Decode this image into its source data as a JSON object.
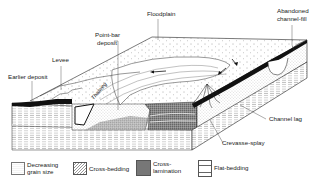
{
  "figure": {
    "type": "block-diagram"
  },
  "labels": {
    "floodplain": "Floodplain",
    "abandoned_channel_fill": "Abandoned\nchannel-fill",
    "abandoned_line1": "Abandoned",
    "abandoned_line2": "channel-fill",
    "point_bar_line1": "Point-bar",
    "point_bar_line2": "deposit",
    "levee": "Levee",
    "earlier_deposit": "Earlier deposit",
    "thalweg": "Thalweg",
    "channel_lag": "Channel lag",
    "crevasse_splay": "Crevasse-splay"
  },
  "legend": {
    "items": [
      {
        "key": "decreasing-grain-size",
        "label": "Decreasing\ngrain size"
      },
      {
        "key": "cross-bedding",
        "label": "Cross-bedding"
      },
      {
        "key": "cross-lamination",
        "label": "Cross-\nlamination"
      },
      {
        "key": "flat-bedding",
        "label": "Flat-bedding"
      }
    ]
  },
  "colors": {
    "ink": "#111111",
    "background": "#ffffff",
    "stipple": "#555555"
  }
}
